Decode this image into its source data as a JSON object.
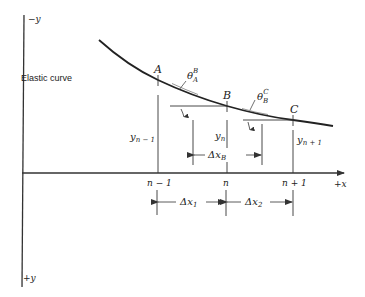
{
  "figure": {
    "axes": {
      "neg_y_label": "−y",
      "pos_y_label": "+y",
      "pos_x_label": "+x"
    },
    "curve_label": "Elastic curve",
    "points": [
      {
        "name": "A",
        "x_label": "n − 1",
        "y_label_base": "y",
        "y_label_sub": "n − 1"
      },
      {
        "name": "B",
        "x_label": "n",
        "y_label_base": "y",
        "y_label_sub": "n"
      },
      {
        "name": "C",
        "x_label": "n + 1",
        "y_label_base": "y",
        "y_label_sub": "n + 1"
      }
    ],
    "angles": [
      {
        "base": "θ",
        "sub": "A",
        "sup": "B"
      },
      {
        "base": "θ",
        "sub": "B",
        "sup": "C"
      }
    ],
    "dimensions": [
      {
        "base": "Δx",
        "sub": "B"
      },
      {
        "base": "Δx",
        "sub": "1"
      },
      {
        "base": "Δx",
        "sub": "2"
      }
    ],
    "colors": {
      "line": "#333333",
      "background": "#ffffff"
    }
  }
}
